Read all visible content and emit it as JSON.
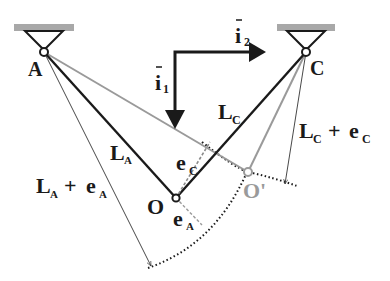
{
  "diagram": {
    "type": "mechanics-cable-suspension",
    "supports": [
      {
        "id": "A",
        "label": "A",
        "x": 44,
        "y": 52
      },
      {
        "id": "C",
        "label": "C",
        "x": 306,
        "y": 52
      }
    ],
    "points": {
      "O": {
        "label": "O",
        "x": 176,
        "y": 198
      },
      "O_prime": {
        "label": "O'",
        "x": 248,
        "y": 172
      }
    },
    "unit_vectors": {
      "i1": {
        "label": "i",
        "subscript": "1",
        "direction": "down"
      },
      "i2": {
        "label": "i",
        "subscript": "2",
        "direction": "right"
      }
    },
    "labels": {
      "LA": {
        "main": "L",
        "sub": "A"
      },
      "LC": {
        "main": "L",
        "sub": "C"
      },
      "eC": {
        "main": "e",
        "sub": "C"
      },
      "eA": {
        "main": "e",
        "sub": "A"
      },
      "LA_plus_eA": {
        "main1": "L",
        "sub1": "A",
        "op": " + ",
        "main2": "e",
        "sub2": "A"
      },
      "LC_plus_eC": {
        "main1": "L",
        "sub1": "C",
        "op": " + ",
        "main2": "e",
        "sub2": "C"
      }
    },
    "colors": {
      "ink": "#1a1a1a",
      "gray": "#9a9a9a",
      "support_bar": "#a8a8a8"
    }
  }
}
